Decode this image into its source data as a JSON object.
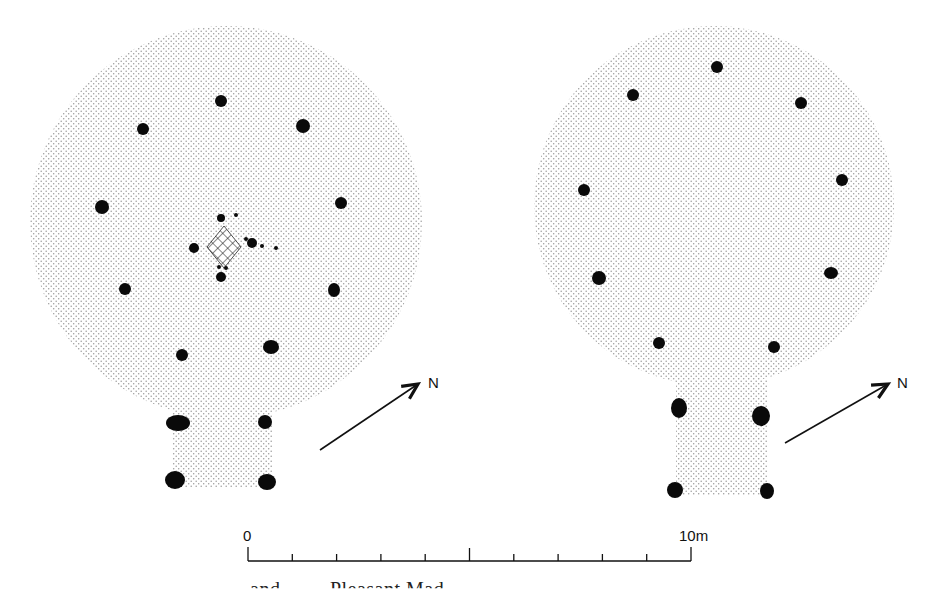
{
  "figure": {
    "type": "archaeological-plan",
    "colors": {
      "floor_stipple": "#9a9a9a",
      "post": "#0a0a0a",
      "hearth_hatch": "#222222",
      "line": "#111111"
    },
    "plans": [
      {
        "id": "left",
        "circle": {
          "cx": 226,
          "cy": 222,
          "r": 196
        },
        "porch": {
          "x": 172,
          "y": 400,
          "w": 100,
          "h": 88
        },
        "posts": [
          {
            "cx": 221,
            "cy": 101,
            "rx": 6,
            "ry": 6
          },
          {
            "cx": 143,
            "cy": 129,
            "rx": 6,
            "ry": 6
          },
          {
            "cx": 303,
            "cy": 126,
            "rx": 7,
            "ry": 7
          },
          {
            "cx": 102,
            "cy": 207,
            "rx": 7,
            "ry": 7
          },
          {
            "cx": 341,
            "cy": 203,
            "rx": 6,
            "ry": 6
          },
          {
            "cx": 125,
            "cy": 289,
            "rx": 6,
            "ry": 6
          },
          {
            "cx": 334,
            "cy": 290,
            "rx": 6,
            "ry": 7
          },
          {
            "cx": 182,
            "cy": 355,
            "rx": 6,
            "ry": 6
          },
          {
            "cx": 271,
            "cy": 347,
            "rx": 8,
            "ry": 7
          },
          {
            "cx": 178,
            "cy": 423,
            "rx": 12,
            "ry": 8
          },
          {
            "cx": 265,
            "cy": 422,
            "rx": 7,
            "ry": 7
          },
          {
            "cx": 175,
            "cy": 480,
            "rx": 10,
            "ry": 9
          },
          {
            "cx": 267,
            "cy": 482,
            "rx": 9,
            "ry": 8
          }
        ],
        "hearth": {
          "cx": 224,
          "cy": 247,
          "w": 34,
          "h": 42
        },
        "stakeholes": [
          {
            "cx": 221,
            "cy": 218,
            "r": 4
          },
          {
            "cx": 236,
            "cy": 215,
            "r": 2
          },
          {
            "cx": 194,
            "cy": 248,
            "r": 5
          },
          {
            "cx": 252,
            "cy": 243,
            "r": 5
          },
          {
            "cx": 246,
            "cy": 239,
            "r": 2
          },
          {
            "cx": 262,
            "cy": 246,
            "r": 2
          },
          {
            "cx": 276,
            "cy": 248,
            "r": 2
          },
          {
            "cx": 219,
            "cy": 267,
            "r": 2
          },
          {
            "cx": 226,
            "cy": 268,
            "r": 2
          },
          {
            "cx": 221,
            "cy": 277,
            "r": 5
          }
        ],
        "north_arrow": {
          "x1": 320,
          "y1": 450,
          "x2": 418,
          "y2": 384,
          "label": "N",
          "lx": 428,
          "ly": 388
        }
      },
      {
        "id": "right",
        "circle": {
          "cx": 714,
          "cy": 206,
          "r": 180
        },
        "porch": {
          "x": 676,
          "y": 380,
          "w": 92,
          "h": 115
        },
        "posts": [
          {
            "cx": 717,
            "cy": 67,
            "rx": 6,
            "ry": 6
          },
          {
            "cx": 633,
            "cy": 95,
            "rx": 6,
            "ry": 6
          },
          {
            "cx": 801,
            "cy": 103,
            "rx": 6,
            "ry": 6
          },
          {
            "cx": 584,
            "cy": 190,
            "rx": 6,
            "ry": 6
          },
          {
            "cx": 842,
            "cy": 180,
            "rx": 6,
            "ry": 6
          },
          {
            "cx": 599,
            "cy": 278,
            "rx": 7,
            "ry": 7
          },
          {
            "cx": 831,
            "cy": 273,
            "rx": 7,
            "ry": 6
          },
          {
            "cx": 659,
            "cy": 343,
            "rx": 6,
            "ry": 6
          },
          {
            "cx": 774,
            "cy": 347,
            "rx": 6,
            "ry": 6
          },
          {
            "cx": 679,
            "cy": 408,
            "rx": 8,
            "ry": 10
          },
          {
            "cx": 761,
            "cy": 416,
            "rx": 9,
            "ry": 10
          },
          {
            "cx": 675,
            "cy": 490,
            "rx": 8,
            "ry": 8
          },
          {
            "cx": 767,
            "cy": 491,
            "rx": 7,
            "ry": 8
          }
        ],
        "north_arrow": {
          "x1": 785,
          "y1": 443,
          "x2": 888,
          "y2": 384,
          "label": "N",
          "lx": 897,
          "ly": 388
        }
      }
    ],
    "scale_bar": {
      "x_start": 248,
      "x_end": 691,
      "y": 561,
      "start_label": "0",
      "end_label": "10m",
      "divisions": 10,
      "unit": "m",
      "length_m": 10
    },
    "caption_partial": "and   ...   ...  Pleasant Mad"
  }
}
